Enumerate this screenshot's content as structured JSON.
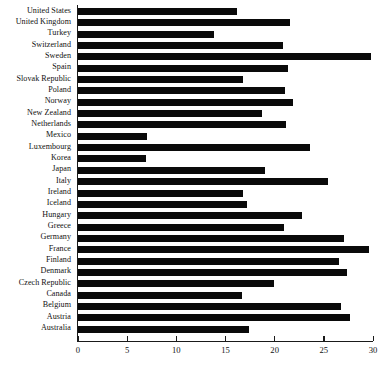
{
  "chart_data": {
    "type": "bar",
    "orientation": "horizontal",
    "title": "",
    "subtitle": "",
    "xlabel": "",
    "ylabel": "",
    "xlim": [
      0,
      30
    ],
    "ylim": null,
    "grid": false,
    "legend": null,
    "xticks": [
      0,
      5,
      10,
      15,
      20,
      25,
      30
    ],
    "xtick_labels": [
      "0",
      "5",
      "10",
      "15",
      "20",
      "25",
      "30"
    ],
    "bar_color": "#0a0a0a",
    "categories": [
      "United States",
      "United Kingdom",
      "Turkey",
      "Switzerland",
      "Sweden",
      "Spain",
      "Slovak Republic",
      "Poland",
      "Norway",
      "New Zealand",
      "Netherlands",
      "Mexico",
      "Luxembourg",
      "Korea",
      "Japan",
      "Italy",
      "Ireland",
      "Iceland",
      "Hungary",
      "Greece",
      "Germany",
      "France",
      "Finland",
      "Denmark",
      "Czech Republic",
      "Canada",
      "Belgium",
      "Austria",
      "Australia"
    ],
    "values": [
      16.2,
      21.6,
      13.8,
      20.8,
      29.8,
      21.4,
      16.8,
      21.1,
      21.9,
      18.7,
      21.2,
      7.0,
      23.6,
      6.9,
      19.0,
      25.4,
      16.8,
      17.2,
      22.8,
      20.9,
      27.0,
      29.6,
      26.5,
      27.4,
      19.9,
      16.7,
      26.7,
      27.7,
      17.4
    ]
  }
}
